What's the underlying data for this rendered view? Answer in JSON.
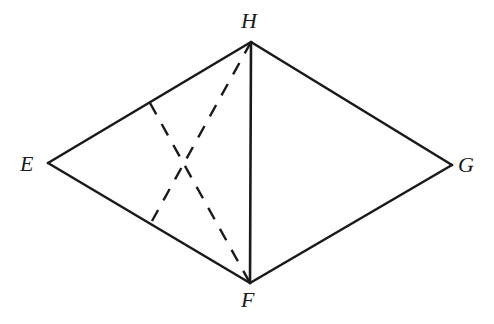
{
  "figure": {
    "background_color": "#ffffff",
    "stroke_color": "#1a1a1a",
    "canvas": {
      "width": 494,
      "height": 324
    }
  },
  "vertices": [
    {
      "id": "E",
      "label": "E",
      "x": 48,
      "y": 163
    },
    {
      "id": "H",
      "label": "H",
      "x": 251,
      "y": 42
    },
    {
      "id": "G",
      "label": "G",
      "x": 452,
      "y": 165
    },
    {
      "id": "F",
      "label": "F",
      "x": 250,
      "y": 283
    }
  ],
  "solid_edges": [
    {
      "name": "edge-E-H",
      "from": "E",
      "to": "H",
      "x1": 48,
      "y1": 163,
      "x2": 251,
      "y2": 42
    },
    {
      "name": "edge-H-G",
      "from": "H",
      "to": "G",
      "x1": 251,
      "y1": 42,
      "x2": 452,
      "y2": 165
    },
    {
      "name": "edge-G-F",
      "from": "G",
      "to": "F",
      "x1": 452,
      "y1": 165,
      "x2": 250,
      "y2": 283
    },
    {
      "name": "edge-F-E",
      "from": "F",
      "to": "E",
      "x1": 250,
      "y1": 283,
      "x2": 48,
      "y2": 163
    },
    {
      "name": "edge-H-F",
      "from": "H",
      "to": "F",
      "x1": 251,
      "y1": 42,
      "x2": 250,
      "y2": 283
    }
  ],
  "dashed_segments": [
    {
      "name": "dashed-segment-1",
      "x1": 150,
      "y1": 103,
      "x2": 250,
      "y2": 283
    },
    {
      "name": "dashed-segment-2",
      "x1": 251,
      "y1": 42,
      "x2": 152,
      "y2": 221
    }
  ],
  "labels": {
    "E": "E",
    "F": "F",
    "G": "G",
    "H": "H"
  }
}
